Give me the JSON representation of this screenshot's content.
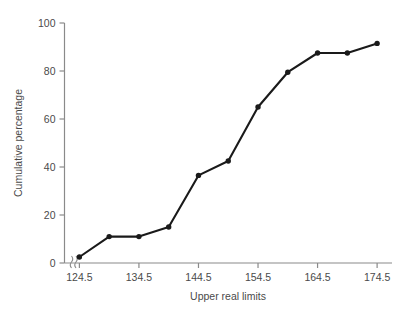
{
  "chart_data": {
    "type": "line",
    "title": "",
    "xlabel": "Upper real limits",
    "ylabel": "Cumulative percentage",
    "x": [
      124.5,
      129.5,
      134.5,
      139.5,
      144.5,
      149.5,
      154.5,
      159.5,
      164.5,
      169.5,
      174.5
    ],
    "values": [
      2.5,
      11.0,
      11.0,
      15.0,
      36.5,
      42.5,
      65.0,
      79.5,
      87.5,
      87.5,
      91.5
    ],
    "series": [
      {
        "name": "Cumulative percentage",
        "values": [
          2.5,
          11.0,
          11.0,
          15.0,
          36.5,
          42.5,
          65.0,
          79.5,
          87.5,
          87.5,
          91.5
        ]
      }
    ],
    "xlim": [
      122.0,
      177.0
    ],
    "ylim": [
      0,
      100
    ],
    "xticks": [
      124.5,
      134.5,
      144.5,
      154.5,
      164.5,
      174.5
    ],
    "xtick_labels": [
      "124.5",
      "134.5",
      "144.5",
      "154.5",
      "164.5",
      "174.5"
    ],
    "yticks": [
      0,
      20,
      40,
      60,
      80,
      100
    ],
    "ytick_labels": [
      "0",
      "20",
      "40",
      "60",
      "80",
      "100"
    ],
    "grid": false,
    "legend": false,
    "legend_position": "none",
    "markers": "filled-circle",
    "axis_break": {
      "axis": "x",
      "symbol": "≈",
      "near": "origin",
      "present": true
    },
    "colors": {
      "line": "#1a1a1a",
      "marker": "#1a1a1a",
      "axis": "#8a8a8a",
      "text": "#4a4a4a",
      "background": "#ffffff"
    }
  },
  "axes": {
    "x_title": "Upper real limits",
    "y_title": "Cumulative percentage"
  }
}
